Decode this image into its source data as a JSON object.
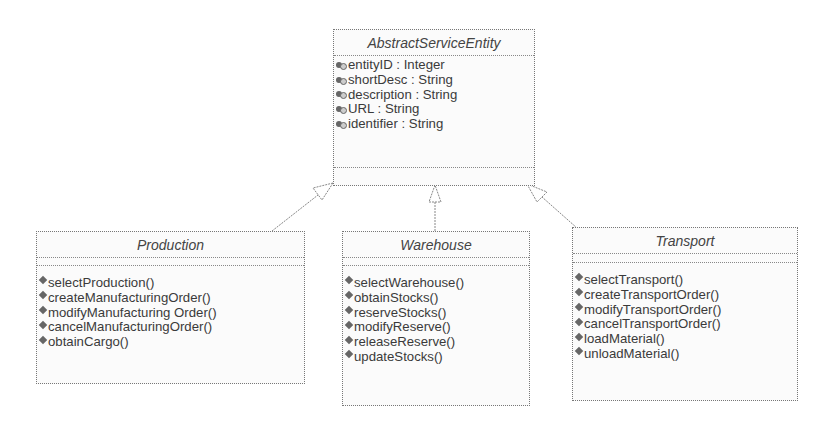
{
  "diagram": {
    "type": "uml-class-diagram",
    "parent": {
      "name": "AbstractServiceEntity",
      "abstract": true,
      "attributes": [
        "entityID : Integer",
        "shortDesc : String",
        "description : String",
        "URL : String",
        "identifier : String"
      ],
      "operations": []
    },
    "children": [
      {
        "name": "Production",
        "attributes": [],
        "operations": [
          "selectProduction()",
          "createManufacturingOrder()",
          "modifyManufacturing Order()",
          "cancelManufacturingOrder()",
          "obtainCargo()"
        ]
      },
      {
        "name": "Warehouse",
        "attributes": [],
        "operations": [
          "selectWarehouse()",
          "obtainStocks()",
          "reserveStocks()",
          "modifyReserve()",
          "releaseReserve()",
          "updateStocks()"
        ]
      },
      {
        "name": "Transport",
        "attributes": [],
        "operations": [
          "selectTransport()",
          "createTransportOrder()",
          "modifyTransportOrder()",
          "cancelTransportOrder()",
          "loadMaterial()",
          "unloadMaterial()"
        ]
      }
    ],
    "relations": [
      {
        "type": "generalization",
        "from": "Production",
        "to": "AbstractServiceEntity"
      },
      {
        "type": "generalization",
        "from": "Warehouse",
        "to": "AbstractServiceEntity"
      },
      {
        "type": "generalization",
        "from": "Transport",
        "to": "AbstractServiceEntity"
      }
    ],
    "colors": {
      "border": "#777777",
      "text": "#3a3a3a",
      "background": "#fbfbfb"
    }
  }
}
